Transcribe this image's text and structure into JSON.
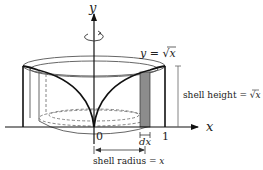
{
  "diagram": {
    "type": "shell-method-volume-of-revolution",
    "axes": {
      "x_label": "x",
      "y_label": "y",
      "origin_label": "0",
      "x_tick_label": "1"
    },
    "curve_label": "y = √x",
    "curve_label_parts": {
      "lhs": "y = ",
      "radical": "√",
      "arg": "x"
    },
    "shell_height_label": "shell height = √x",
    "shell_height_parts": {
      "text": "shell height = ",
      "radical": "√",
      "arg": "x"
    },
    "dx_label": "dx",
    "shell_radius_label": "shell radius = x",
    "shell_radius_parts": {
      "text": "shell radius = ",
      "var": "x"
    },
    "rotation_indicator": "rotation-about-y-axis",
    "colors": {
      "curve": "#111111",
      "shell_fill": "#8c8c8c",
      "cylinder_outline": "#555555",
      "dashed": "#777777",
      "dimension": "#666666"
    }
  }
}
